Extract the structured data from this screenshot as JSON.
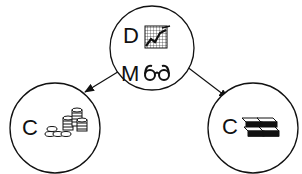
{
  "diagram": {
    "colors": {
      "stroke": "#111111",
      "background": "#ffffff"
    },
    "nodes": [
      {
        "id": "top",
        "lines": [
          {
            "label": "D",
            "icon": "chart-grid-icon"
          },
          {
            "label": "M",
            "icon": "glasses-icon"
          }
        ]
      },
      {
        "id": "left",
        "label": "C",
        "icon": "coins-stack-icon"
      },
      {
        "id": "right",
        "label": "C",
        "icon": "cash-bundles-icon"
      }
    ],
    "edges": [
      {
        "from": "top",
        "to": "left",
        "arrow": "filled"
      },
      {
        "from": "top",
        "to": "right",
        "arrow": "filled"
      }
    ]
  }
}
